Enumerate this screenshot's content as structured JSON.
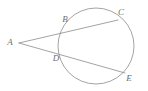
{
  "figure": {
    "type": "circle-secant-diagram",
    "canvas": {
      "width": 148,
      "height": 91,
      "background": "#ffffff"
    },
    "style": {
      "stroke_color": "#8c8c8c",
      "circle_stroke_color": "#8c8c8c",
      "label_color": "#6e6e6e",
      "stroke_width": 0.8,
      "label_font_size": 9,
      "label_font_style": "italic"
    },
    "circle": {
      "name": "main-circle",
      "cx": 96,
      "cy": 46,
      "r": 38
    },
    "points": [
      {
        "id": "A",
        "label": "A",
        "x": 19,
        "y": 43,
        "label_x": 10,
        "label_y": 45,
        "role": "external-vertex"
      },
      {
        "id": "B",
        "label": "B",
        "x": 70,
        "y": 27,
        "label_x": 65,
        "label_y": 22,
        "role": "near-intersection-upper"
      },
      {
        "id": "C",
        "label": "C",
        "x": 118,
        "y": 20,
        "label_x": 121,
        "label_y": 15,
        "role": "far-intersection-upper"
      },
      {
        "id": "D",
        "label": "D",
        "x": 64,
        "y": 57,
        "label_x": 56,
        "label_y": 61,
        "role": "near-intersection-lower"
      },
      {
        "id": "E",
        "label": "E",
        "x": 125,
        "y": 73,
        "label_x": 129,
        "label_y": 81,
        "role": "far-intersection-lower"
      }
    ],
    "segments": [
      {
        "id": "AC",
        "name": "secant-a-to-c",
        "from": "A",
        "to": "C",
        "x1": 19,
        "y1": 43,
        "x2": 118,
        "y2": 20
      },
      {
        "id": "AE",
        "name": "secant-a-to-e",
        "from": "A",
        "to": "E",
        "x1": 19,
        "y1": 43,
        "x2": 125,
        "y2": 73
      }
    ]
  }
}
